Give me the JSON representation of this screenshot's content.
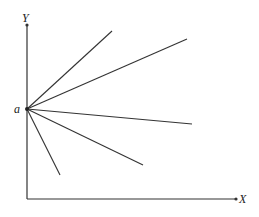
{
  "diagram": {
    "axes": {
      "x_label": "X",
      "y_label": "Y",
      "origin_px": [
        27,
        199
      ],
      "x_end_px": [
        236,
        199
      ],
      "y_end_px": [
        27,
        25
      ]
    },
    "point": {
      "label": "a",
      "px": [
        27,
        109
      ]
    },
    "rays": [
      {
        "name": "ray-1",
        "from": [
          27,
          109
        ],
        "to": [
          112,
          31
        ]
      },
      {
        "name": "ray-2",
        "from": [
          27,
          109
        ],
        "to": [
          187,
          39
        ]
      },
      {
        "name": "ray-3",
        "from": [
          27,
          109
        ],
        "to": [
          192,
          124
        ]
      },
      {
        "name": "ray-4",
        "from": [
          27,
          109
        ],
        "to": [
          143,
          165
        ]
      },
      {
        "name": "ray-5",
        "from": [
          27,
          109
        ],
        "to": [
          60,
          175
        ]
      }
    ],
    "colors": {
      "line": "#333333",
      "background": "#ffffff"
    }
  }
}
